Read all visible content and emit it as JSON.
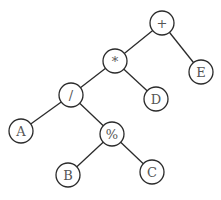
{
  "diagram": {
    "type": "expression-tree",
    "nodes": [
      {
        "id": "plus",
        "label": "+",
        "x": 162,
        "y": 23
      },
      {
        "id": "times",
        "label": "*",
        "x": 115,
        "y": 61
      },
      {
        "id": "E",
        "label": "E",
        "x": 201,
        "y": 72
      },
      {
        "id": "divide",
        "label": "/",
        "x": 71,
        "y": 95
      },
      {
        "id": "D",
        "label": "D",
        "x": 156,
        "y": 99
      },
      {
        "id": "A",
        "label": "A",
        "x": 21,
        "y": 131
      },
      {
        "id": "mod",
        "label": "%",
        "x": 112,
        "y": 134
      },
      {
        "id": "B",
        "label": "B",
        "x": 68,
        "y": 175
      },
      {
        "id": "C",
        "label": "C",
        "x": 152,
        "y": 172
      }
    ],
    "edges": [
      [
        "plus",
        "times"
      ],
      [
        "plus",
        "E"
      ],
      [
        "times",
        "divide"
      ],
      [
        "times",
        "D"
      ],
      [
        "divide",
        "A"
      ],
      [
        "divide",
        "mod"
      ],
      [
        "mod",
        "B"
      ],
      [
        "mod",
        "C"
      ]
    ],
    "node_radius": 12
  }
}
